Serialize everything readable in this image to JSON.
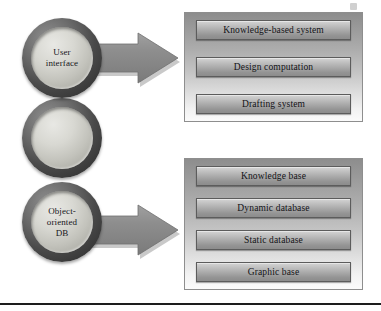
{
  "diagram": {
    "type": "block-diagram",
    "rings": [
      {
        "id": "ring-1",
        "label": "User\ninterface",
        "has_label": true
      },
      {
        "id": "ring-2",
        "label": "",
        "has_label": false
      },
      {
        "id": "ring-3",
        "label": "Object-\noriented\nDB",
        "has_label": true
      }
    ],
    "arrows": [
      {
        "id": "arrow-1",
        "direction": "right",
        "from": "User interface",
        "to": "Upper component panel"
      },
      {
        "id": "arrow-2",
        "direction": "right",
        "from": "Object-oriented DB",
        "to": "Lower component panel"
      }
    ],
    "panels": [
      {
        "id": "panel-top",
        "nodes": [
          "Knowledge-based system",
          "Design computation",
          "Drafting system"
        ]
      },
      {
        "id": "panel-bottom",
        "nodes": [
          "Knowledge base",
          "Dynamic database",
          "Static database",
          "Graphic base"
        ]
      }
    ],
    "colors": {
      "ring_outer": "#4a4a4a",
      "ring_inner": "#d8d8d2",
      "arrow_fill": "#8a8a8a",
      "panel_top_fill": "#8d8d8d",
      "panel_bottom_fill": "#fbfbfb",
      "node_fill": "#a8a8a8",
      "node_border": "#5c5c5c",
      "rule": "#1d1d1d",
      "text": "#121216"
    }
  }
}
